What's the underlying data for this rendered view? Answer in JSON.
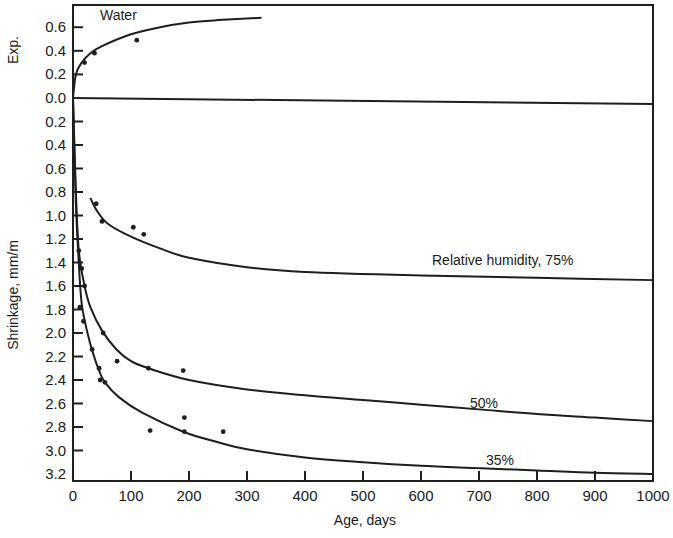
{
  "chart_data": {
    "type": "line",
    "title": "",
    "xlabel": "Age, days",
    "ylabel_top": "Exp.",
    "ylabel": "Shrinkage, mm/m",
    "xlim": [
      0,
      1000
    ],
    "ylim_expansion": [
      0,
      0.7
    ],
    "ylim_shrinkage": [
      0,
      3.2
    ],
    "grid": false,
    "x_ticks": [
      0,
      100,
      200,
      300,
      400,
      500,
      600,
      700,
      800,
      900,
      1000
    ],
    "x_tick_labels": [
      "0",
      "100",
      "200",
      "300",
      "400",
      "500",
      "600",
      "700",
      "800",
      "900",
      "1000"
    ],
    "y_ticks_expansion": [
      0.6,
      0.4,
      0.2,
      0.0
    ],
    "y_tick_labels_expansion": [
      "0.6",
      "0.4",
      "0.2",
      "0.0"
    ],
    "y_ticks_shrinkage": [
      0.2,
      0.4,
      0.6,
      0.8,
      1.0,
      1.2,
      1.4,
      1.6,
      1.8,
      2.0,
      2.2,
      2.4,
      2.6,
      2.8,
      3.0,
      3.2
    ],
    "y_tick_labels_shrinkage": [
      "0.2",
      "0.4",
      "0.6",
      "0.8",
      "1.0",
      "1.2",
      "1.4",
      "1.6",
      "1.8",
      "2.0",
      "2.2",
      "2.4",
      "2.6",
      "2.8",
      "3.0",
      "3.2"
    ],
    "series": [
      {
        "name": "Water",
        "label": "Water",
        "kind": "expansion",
        "curve": {
          "x": [
            0,
            5,
            15,
            30,
            50,
            100,
            150,
            200,
            250,
            325
          ],
          "y": [
            0,
            0.2,
            0.3,
            0.38,
            0.44,
            0.54,
            0.6,
            0.64,
            0.66,
            0.68
          ]
        },
        "points": {
          "x": [
            20,
            37,
            110
          ],
          "y": [
            0.3,
            0.38,
            0.49
          ]
        }
      },
      {
        "name": "Relative humidity, 75%",
        "label": "Relative humidity, 75%",
        "kind": "shrinkage",
        "curve": {
          "x": [
            30,
            40,
            60,
            100,
            150,
            200,
            300,
            400,
            600,
            800,
            1000
          ],
          "y": [
            0.85,
            0.95,
            1.07,
            1.18,
            1.28,
            1.36,
            1.44,
            1.48,
            1.51,
            1.53,
            1.55
          ]
        },
        "points": {
          "x": [
            40,
            50,
            104,
            122
          ],
          "y": [
            0.9,
            1.05,
            1.1,
            1.16
          ]
        }
      },
      {
        "name": "50%",
        "label": "50%",
        "kind": "shrinkage",
        "curve": {
          "x": [
            0,
            5,
            10,
            20,
            30,
            50,
            75,
            100,
            130,
            200,
            300,
            400,
            500,
            600,
            700,
            800,
            900,
            1000
          ],
          "y": [
            0,
            0.8,
            1.3,
            1.6,
            1.78,
            1.98,
            2.14,
            2.24,
            2.3,
            2.4,
            2.48,
            2.53,
            2.57,
            2.61,
            2.65,
            2.69,
            2.72,
            2.75
          ]
        },
        "points": {
          "x": [
            10,
            15,
            20,
            52,
            76,
            130,
            190
          ],
          "y": [
            1.3,
            1.45,
            1.6,
            2.0,
            2.24,
            2.3,
            2.32
          ]
        }
      },
      {
        "name": "35%",
        "label": "35%",
        "kind": "shrinkage",
        "curve": {
          "x": [
            0,
            5,
            10,
            15,
            25,
            35,
            45,
            55,
            80,
            120,
            190,
            250,
            300,
            400,
            500,
            600,
            700,
            800,
            900,
            1000
          ],
          "y": [
            0,
            0.9,
            1.4,
            1.75,
            2.0,
            2.18,
            2.32,
            2.42,
            2.55,
            2.68,
            2.84,
            2.93,
            2.99,
            3.06,
            3.1,
            3.13,
            3.15,
            3.17,
            3.19,
            3.2
          ]
        },
        "points": {
          "x": [
            12,
            18,
            33,
            45,
            47,
            55,
            133,
            192,
            192,
            259
          ],
          "y": [
            1.78,
            1.9,
            2.14,
            2.3,
            2.4,
            2.42,
            2.83,
            2.72,
            2.84,
            2.84
          ]
        }
      }
    ]
  }
}
